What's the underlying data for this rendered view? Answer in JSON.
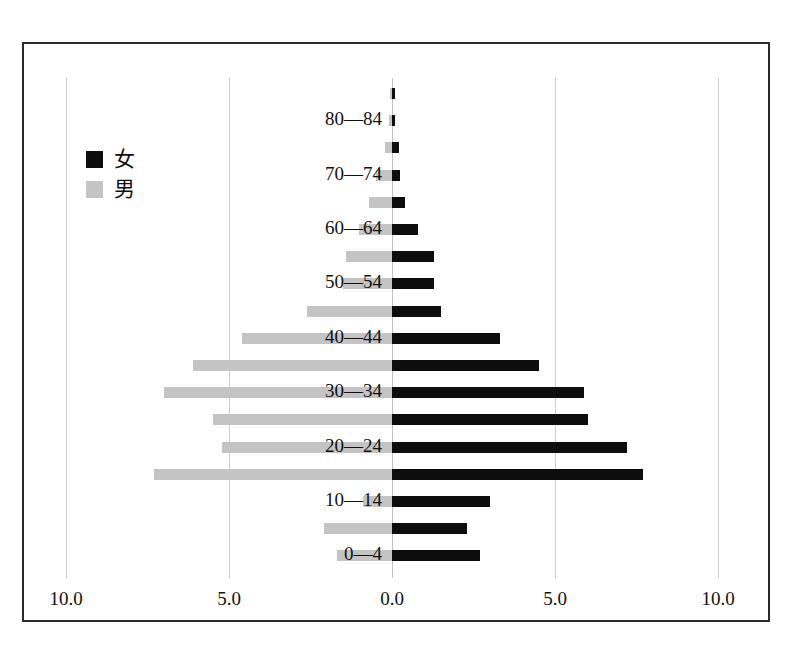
{
  "chart_data": {
    "type": "bar",
    "subtype": "population-pyramid",
    "title": "",
    "xlabel": "",
    "ylabel": "",
    "grid": true,
    "legend_position": "upper-left",
    "xlim": [
      -10.0,
      10.0
    ],
    "axis_tick_labels": [
      "10.0",
      "5.0",
      "0.0",
      "5.0",
      "10.0"
    ],
    "axis_tick_values": [
      -10.0,
      -5.0,
      0.0,
      5.0,
      10.0
    ],
    "categories": [
      "0—4",
      "5—9",
      "10—14",
      "15—19",
      "20—24",
      "25—29",
      "30—34",
      "35—39",
      "40—44",
      "45—49",
      "50—54",
      "55—59",
      "60—64",
      "65—69",
      "70—74",
      "75—79",
      "80—84",
      "85+"
    ],
    "visible_category_labels": [
      "0—4",
      "10—14",
      "20—24",
      "30—34",
      "40—44",
      "50—54",
      "60—64",
      "70—74",
      "80—84"
    ],
    "series": [
      {
        "name": "女",
        "color": "#0d0d0d",
        "side": "right",
        "values": [
          2.7,
          2.3,
          3.0,
          7.7,
          7.2,
          6.0,
          5.9,
          4.5,
          3.3,
          1.5,
          1.3,
          1.3,
          0.8,
          0.4,
          0.25,
          0.2,
          0.1,
          0.1
        ]
      },
      {
        "name": "男",
        "color": "#c4c4c4",
        "side": "left",
        "values": [
          1.7,
          2.1,
          0.9,
          7.3,
          5.2,
          5.5,
          7.0,
          6.1,
          4.6,
          2.6,
          1.5,
          1.4,
          1.0,
          0.7,
          0.5,
          0.2,
          0.1,
          0.05
        ]
      }
    ]
  },
  "legend": {
    "items": [
      {
        "label": "女",
        "color": "#0d0d0d"
      },
      {
        "label": "男",
        "color": "#c4c4c4"
      }
    ]
  },
  "axis": {
    "ticks": [
      {
        "label": "10.0",
        "value": -10.0
      },
      {
        "label": "5.0",
        "value": -5.0
      },
      {
        "label": "0.0",
        "value": 0.0
      },
      {
        "label": "5.0",
        "value": 5.0
      },
      {
        "label": "10.0",
        "value": 10.0
      }
    ]
  },
  "colors": {
    "female": "#0d0d0d",
    "male": "#c4c4c4",
    "gridline": "#cccccc",
    "frame": "#2b2b2b",
    "background": "#ffffff"
  }
}
